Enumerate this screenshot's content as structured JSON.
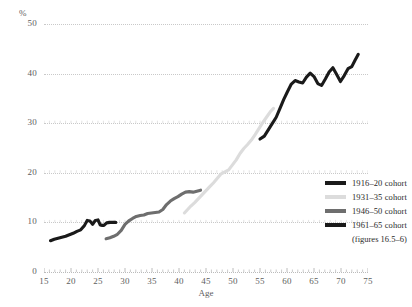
{
  "chart_data": {
    "type": "line",
    "title": "",
    "xlabel": "Age",
    "ylabel": "%",
    "xlim": [
      15,
      75
    ],
    "ylim": [
      0,
      50
    ],
    "xticks": [
      15,
      20,
      25,
      30,
      35,
      40,
      45,
      50,
      55,
      60,
      65,
      70,
      75
    ],
    "yticks": [
      0,
      10,
      20,
      30,
      40,
      50
    ],
    "grid": true,
    "legend_position": "right",
    "legend_note": "(figures 16.5–6)",
    "series": [
      {
        "name": "1916–20 cohort",
        "color": "#1a1a1a",
        "x": [
          55.0,
          55.8,
          56.5,
          57.2,
          58.0,
          58.7,
          59.4,
          60.1,
          60.8,
          61.5,
          62.2,
          62.9,
          63.6,
          64.3,
          65.0,
          65.7,
          66.4,
          67.1,
          67.8,
          68.5,
          69.2,
          69.9,
          70.6,
          71.3,
          72.0,
          72.6,
          73.2
        ],
        "y": [
          26.8,
          27.4,
          28.6,
          29.8,
          31.2,
          33.0,
          34.8,
          36.4,
          37.9,
          38.6,
          38.3,
          38.1,
          39.3,
          40.1,
          39.4,
          38.0,
          37.6,
          38.9,
          40.3,
          41.2,
          39.8,
          38.4,
          39.6,
          41.0,
          41.4,
          42.7,
          43.9
        ]
      },
      {
        "name": "1931–35 cohort",
        "color": "#dcdcdc",
        "x": [
          41.0,
          41.6,
          42.2,
          42.9,
          43.6,
          44.3,
          45.0,
          45.7,
          46.4,
          47.1,
          47.8,
          48.5,
          49.2,
          49.9,
          50.6,
          51.3,
          52.0,
          52.7,
          53.4,
          54.1,
          54.8,
          55.5,
          56.2,
          56.9,
          57.5
        ],
        "y": [
          11.9,
          12.6,
          13.3,
          14.0,
          14.8,
          15.6,
          16.4,
          17.2,
          18.0,
          18.9,
          19.8,
          20.2,
          20.6,
          21.6,
          22.6,
          23.9,
          24.9,
          25.7,
          26.6,
          27.7,
          28.9,
          30.1,
          31.2,
          32.3,
          33.0
        ]
      },
      {
        "name": "1946–50 cohort",
        "color": "#6e6e6e",
        "x": [
          26.5,
          27.2,
          27.9,
          28.6,
          29.3,
          30.0,
          30.7,
          31.4,
          32.1,
          32.8,
          33.5,
          34.2,
          34.9,
          35.6,
          36.3,
          37.0,
          37.7,
          38.4,
          39.1,
          39.8,
          40.5,
          41.2,
          41.9,
          42.6,
          43.3,
          44.0
        ],
        "y": [
          6.7,
          6.9,
          7.2,
          7.6,
          8.4,
          9.6,
          10.3,
          10.8,
          11.2,
          11.4,
          11.5,
          11.8,
          11.9,
          12.0,
          12.1,
          12.6,
          13.6,
          14.3,
          14.8,
          15.2,
          15.7,
          16.1,
          16.2,
          16.1,
          16.3,
          16.5
        ]
      },
      {
        "name": "1961–65 cohort",
        "color": "#1a1a1a",
        "x": [
          16.2,
          16.9,
          17.6,
          18.3,
          19.0,
          19.7,
          20.4,
          21.1,
          21.8,
          22.5,
          23.0,
          23.5,
          24.0,
          24.5,
          25.0,
          25.4,
          25.8,
          26.1,
          26.6,
          27.2,
          27.8,
          28.3
        ],
        "y": [
          6.3,
          6.6,
          6.8,
          7.0,
          7.2,
          7.5,
          7.8,
          8.2,
          8.5,
          9.4,
          10.4,
          10.3,
          9.6,
          10.4,
          10.5,
          9.5,
          9.4,
          9.4,
          9.9,
          10.0,
          10.0,
          10.0
        ]
      }
    ]
  },
  "axes": {
    "y_label": "%",
    "x_label": "Age",
    "y_tick_labels": [
      "0",
      "10",
      "20",
      "30",
      "40",
      "50"
    ],
    "x_tick_labels": [
      "15",
      "20",
      "25",
      "30",
      "35",
      "40",
      "45",
      "50",
      "55",
      "60",
      "65",
      "70",
      "75"
    ]
  },
  "legend": {
    "items": [
      {
        "label": "1916–20 cohort",
        "color": "#1a1a1a"
      },
      {
        "label": "1931–35 cohort",
        "color": "#dcdcdc"
      },
      {
        "label": "1946–50 cohort",
        "color": "#6e6e6e"
      },
      {
        "label": "1961–65 cohort",
        "color": "#1a1a1a"
      }
    ],
    "note": "(figures 16.5–6)"
  }
}
